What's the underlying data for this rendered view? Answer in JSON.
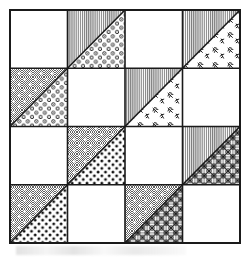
{
  "figure": {
    "frame": {
      "x": 10,
      "y": 10,
      "width": 230,
      "height": 233,
      "border_color": "#1a1a1a",
      "border_width": 2,
      "background_color": "#ffffff"
    },
    "grid": {
      "rows": 4,
      "cols": 4,
      "cell_width": 57.5,
      "cell_height": 58.25,
      "line_color": "#1a1a1a",
      "line_width": 1.6
    },
    "colors": {
      "ink": "#1a1a1a",
      "paper": "#ffffff",
      "gray_stripe": "#8c8c8c",
      "gray_stipple": "#9a9a9a",
      "accent": "#000000"
    },
    "patterns": [
      {
        "id": "plain",
        "name": "plain-white",
        "label": "Plain"
      },
      {
        "id": "stripe",
        "name": "vertical-stripe",
        "label": "Vertical stripe"
      },
      {
        "id": "stipple",
        "name": "gray-stipple-star-dots",
        "label": "Gray stipple with white dots"
      },
      {
        "id": "ring",
        "name": "small-ring-dots",
        "label": "Small rings"
      },
      {
        "id": "leaf",
        "name": "leaf-sprig",
        "label": "Leaf sprig"
      },
      {
        "id": "dot",
        "name": "bold-polka-dot",
        "label": "Bold polka dot"
      },
      {
        "id": "lattice",
        "name": "diagonal-lattice-net",
        "label": "Diagonal lattice net"
      }
    ],
    "cells": [
      {
        "row": 0,
        "col": 0,
        "type": "plain",
        "upper": "plain",
        "lower": "plain",
        "diagonal": "none"
      },
      {
        "row": 0,
        "col": 1,
        "type": "triangle",
        "upper": "stripe",
        "lower": "ring",
        "diagonal": "tl-br"
      },
      {
        "row": 0,
        "col": 2,
        "type": "plain",
        "upper": "plain",
        "lower": "plain",
        "diagonal": "none"
      },
      {
        "row": 0,
        "col": 3,
        "type": "triangle",
        "upper": "stripe",
        "lower": "leaf",
        "diagonal": "tl-br"
      },
      {
        "row": 1,
        "col": 0,
        "type": "triangle",
        "upper": "stipple",
        "lower": "ring",
        "diagonal": "tl-br"
      },
      {
        "row": 1,
        "col": 1,
        "type": "plain",
        "upper": "plain",
        "lower": "plain",
        "diagonal": "none"
      },
      {
        "row": 1,
        "col": 2,
        "type": "triangle",
        "upper": "stripe",
        "lower": "leaf",
        "diagonal": "tl-br"
      },
      {
        "row": 1,
        "col": 3,
        "type": "plain",
        "upper": "plain",
        "lower": "plain",
        "diagonal": "none"
      },
      {
        "row": 2,
        "col": 0,
        "type": "plain",
        "upper": "plain",
        "lower": "plain",
        "diagonal": "none"
      },
      {
        "row": 2,
        "col": 1,
        "type": "triangle",
        "upper": "stipple",
        "lower": "dot",
        "diagonal": "tl-br"
      },
      {
        "row": 2,
        "col": 2,
        "type": "plain",
        "upper": "plain",
        "lower": "plain",
        "diagonal": "none"
      },
      {
        "row": 2,
        "col": 3,
        "type": "triangle",
        "upper": "stripe",
        "lower": "lattice",
        "diagonal": "tl-br"
      },
      {
        "row": 3,
        "col": 0,
        "type": "triangle",
        "upper": "stipple",
        "lower": "dot",
        "diagonal": "tl-br"
      },
      {
        "row": 3,
        "col": 1,
        "type": "plain",
        "upper": "plain",
        "lower": "plain",
        "diagonal": "none"
      },
      {
        "row": 3,
        "col": 2,
        "type": "triangle",
        "upper": "stipple",
        "lower": "lattice",
        "diagonal": "tl-br"
      },
      {
        "row": 3,
        "col": 3,
        "type": "plain",
        "upper": "plain",
        "lower": "plain",
        "diagonal": "none"
      }
    ]
  }
}
